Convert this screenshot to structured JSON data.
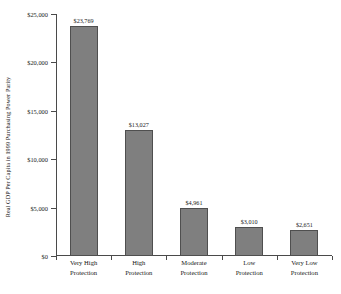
{
  "chart_data": {
    "type": "bar",
    "title": "",
    "xlabel": "",
    "ylabel": "Real GDP Per Capita in 1999 Purchasing Power Parity",
    "categories": [
      "Very High Protection",
      "High Protection",
      "Moderate Protection",
      "Low Protection",
      "Very Low Protection"
    ],
    "category_lines": [
      [
        "Very High",
        "Protection"
      ],
      [
        "High",
        "Protection"
      ],
      [
        "Moderate",
        "Protection"
      ],
      [
        "Low",
        "Protection"
      ],
      [
        "Very Low",
        "Protection"
      ]
    ],
    "values": [
      23769,
      13027,
      4961,
      3010,
      2651
    ],
    "value_labels": [
      "$23,769",
      "$13,027",
      "$4,961",
      "$3,010",
      "$2,651"
    ],
    "ylim": [
      0,
      25000
    ],
    "ytick_values": [
      0,
      5000,
      10000,
      15000,
      20000,
      25000
    ],
    "ytick_labels": [
      "$0",
      "$5,000",
      "$10,000",
      "$15,000",
      "$20,000",
      "$25,000"
    ],
    "grid": false,
    "legend": false,
    "bar_color": "#7f7f7f",
    "bar_edge_color": "#4f4f4f",
    "axis_color": "#4a4a4a"
  }
}
